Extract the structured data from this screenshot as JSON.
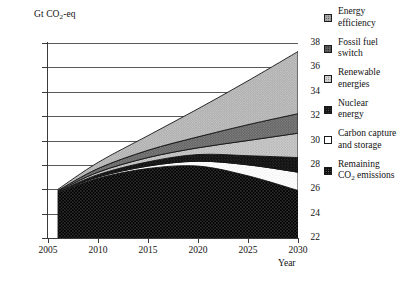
{
  "axes": {
    "ylabel": "Gt CO2-eq",
    "ylabel_main": "Gt CO",
    "ylabel_sub": "2",
    "ylabel_tail": "-eq",
    "xlabel": "Year",
    "yticks": [
      "38",
      "36",
      "34",
      "32",
      "30",
      "28",
      "26",
      "24",
      "22"
    ],
    "xticks": [
      "2005",
      "2010",
      "2015",
      "2020",
      "2025",
      "2030"
    ]
  },
  "legend": {
    "items": [
      {
        "label": "Energy\nefficiency",
        "swatch": "checker-medium-gray",
        "color": "#8a8a8a"
      },
      {
        "label": "Fossil fuel\nswitch",
        "swatch": "checker-dark-gray",
        "color": "#555555"
      },
      {
        "label": "Renewable\nenergies",
        "swatch": "checker-light-gray",
        "color": "#c2c2c2"
      },
      {
        "label": "Nuclear\nenergy",
        "swatch": "checker-black",
        "color": "#1a1a1a"
      },
      {
        "label": "Carbon capture\nand storage",
        "swatch": "white-empty",
        "color": "#ffffff"
      },
      {
        "label": "Remaining\nCO2 emissions",
        "swatch": "dotted-black",
        "color": "#0d0d0d",
        "label_pre": "Remaining\nCO",
        "label_sub": "2",
        "label_post": " emissions"
      }
    ]
  },
  "chart_data": {
    "type": "area",
    "title": "",
    "xlabel": "Year",
    "ylabel": "Gt CO2-eq",
    "xlim": [
      2005,
      2030
    ],
    "ylim": [
      22,
      38
    ],
    "grid": true,
    "legend_position": "right",
    "stacked": true,
    "baseline": 22,
    "x": [
      2006,
      2010,
      2015,
      2020,
      2025,
      2030
    ],
    "series": [
      {
        "name": "Remaining CO2 emissions",
        "order": 1,
        "cumulative_top": [
          25.7,
          26.9,
          27.7,
          27.9,
          27.1,
          25.9
        ],
        "values": [
          3.7,
          4.9,
          5.7,
          5.9,
          5.1,
          3.9
        ]
      },
      {
        "name": "Carbon capture and storage",
        "order": 2,
        "cumulative_top": [
          25.75,
          27.0,
          27.9,
          28.3,
          28.0,
          27.4
        ],
        "values": [
          0.05,
          0.1,
          0.2,
          0.4,
          0.9,
          1.5
        ]
      },
      {
        "name": "Nuclear energy",
        "order": 3,
        "cumulative_top": [
          25.8,
          27.2,
          28.25,
          28.85,
          28.75,
          28.6
        ],
        "values": [
          0.05,
          0.2,
          0.35,
          0.55,
          0.75,
          1.2
        ]
      },
      {
        "name": "Renewable energies",
        "order": 4,
        "cumulative_top": [
          25.85,
          27.4,
          28.6,
          29.4,
          30.0,
          30.6
        ],
        "values": [
          0.05,
          0.2,
          0.35,
          0.55,
          1.25,
          2.0
        ]
      },
      {
        "name": "Fossil fuel switch",
        "order": 5,
        "cumulative_top": [
          25.9,
          27.7,
          29.2,
          30.3,
          31.3,
          32.2
        ],
        "values": [
          0.05,
          0.3,
          0.6,
          0.9,
          1.3,
          1.6
        ]
      },
      {
        "name": "Energy efficiency",
        "order": 6,
        "cumulative_top": [
          26.0,
          28.2,
          30.4,
          32.6,
          34.9,
          37.3
        ],
        "values": [
          0.1,
          0.5,
          1.2,
          2.3,
          3.6,
          5.1
        ]
      }
    ]
  }
}
